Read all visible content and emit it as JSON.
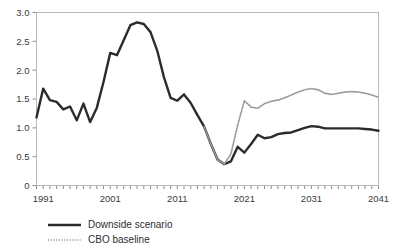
{
  "chart_data": {
    "type": "line",
    "title": "",
    "subtitle": "",
    "xlabel": "",
    "ylabel": "",
    "xlim": [
      1990,
      2041
    ],
    "ylim": [
      0,
      3.0
    ],
    "grid": false,
    "legend_position": "bottom-left",
    "y_ticks": [
      0,
      0.5,
      1.0,
      1.5,
      2.0,
      2.5,
      3.0
    ],
    "y_tick_labels": [
      "0",
      "0.5",
      "1.0",
      "1.5",
      "2.0",
      "2.5",
      "3.0"
    ],
    "x_ticks": [
      1991,
      2001,
      2011,
      2021,
      2031,
      2041
    ],
    "x_tick_labels": [
      "1991",
      "2001",
      "2011",
      "2021",
      "2031",
      "2041"
    ],
    "x_minor_tick_interval": 1,
    "series": [
      {
        "name": "Downside scenario",
        "style": "solid",
        "color": "#2b2b2b",
        "x": [
          1990,
          1991,
          1992,
          1993,
          1994,
          1995,
          1996,
          1997,
          1998,
          1999,
          2000,
          2001,
          2002,
          2003,
          2004,
          2005,
          2006,
          2007,
          2008,
          2009,
          2010,
          2011,
          2012,
          2013,
          2014,
          2015,
          2016,
          2017,
          2018,
          2019,
          2020,
          2021,
          2022,
          2023,
          2024,
          2025,
          2026,
          2027,
          2028,
          2029,
          2030,
          2031,
          2032,
          2033,
          2034,
          2035,
          2036,
          2037,
          2038,
          2039,
          2040,
          2041
        ],
        "y": [
          1.18,
          1.68,
          1.48,
          1.45,
          1.32,
          1.37,
          1.13,
          1.42,
          1.1,
          1.35,
          1.8,
          2.3,
          2.26,
          2.52,
          2.78,
          2.83,
          2.8,
          2.66,
          2.34,
          1.88,
          1.52,
          1.47,
          1.58,
          1.43,
          1.22,
          1.02,
          0.72,
          0.45,
          0.37,
          0.42,
          0.67,
          0.57,
          0.72,
          0.88,
          0.82,
          0.84,
          0.89,
          0.91,
          0.92,
          0.96,
          1.0,
          1.03,
          1.02,
          0.99,
          0.99,
          0.99,
          0.99,
          0.99,
          0.99,
          0.98,
          0.97,
          0.95
        ]
      },
      {
        "name": "CBO baseline",
        "style": "dotted",
        "color": "#9a9a9a",
        "x": [
          2015,
          2016,
          2017,
          2018,
          2019,
          2020,
          2021,
          2022,
          2023,
          2024,
          2025,
          2026,
          2027,
          2028,
          2029,
          2030,
          2031,
          2032,
          2033,
          2034,
          2035,
          2036,
          2037,
          2038,
          2039,
          2040,
          2041
        ],
        "y": [
          1.02,
          0.72,
          0.45,
          0.37,
          0.55,
          1.05,
          1.47,
          1.36,
          1.34,
          1.42,
          1.46,
          1.48,
          1.52,
          1.57,
          1.62,
          1.66,
          1.68,
          1.66,
          1.6,
          1.58,
          1.6,
          1.62,
          1.63,
          1.62,
          1.6,
          1.57,
          1.53
        ]
      }
    ]
  },
  "legend": {
    "items": [
      {
        "label": "Downside scenario",
        "style": "solid"
      },
      {
        "label": "CBO baseline",
        "style": "dotted"
      }
    ]
  }
}
